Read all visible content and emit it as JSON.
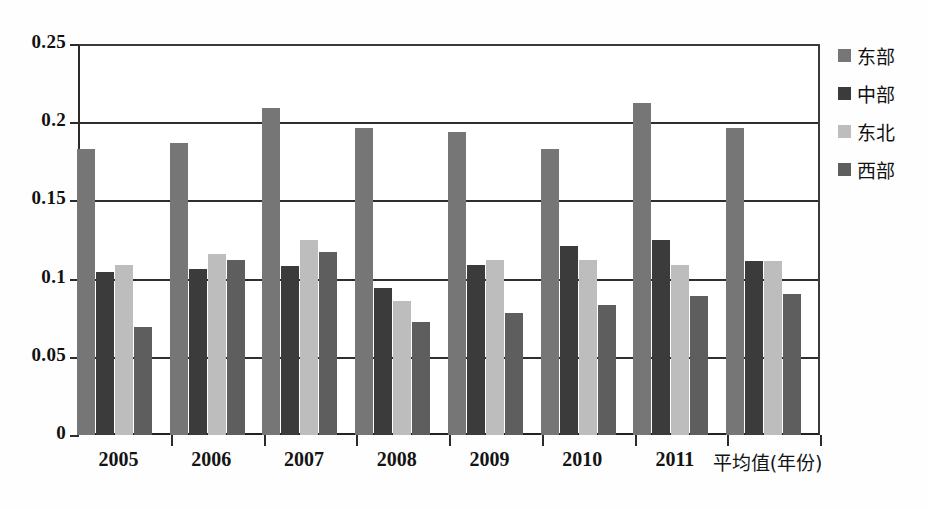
{
  "chart_data": {
    "type": "bar",
    "title": "",
    "xlabel": "平均值(年份)",
    "ylabel": "",
    "ylim": [
      0,
      0.25
    ],
    "ytick_labels": [
      "0.25",
      "0.2",
      "0.15",
      "0.1",
      "0.05",
      "0"
    ],
    "ytick_values": [
      0.25,
      0.2,
      0.15,
      0.1,
      0.05,
      0
    ],
    "grid": true,
    "legend_position": "right",
    "categories": [
      "2005",
      "2006",
      "2007",
      "2008",
      "2009",
      "2010",
      "2011",
      "平均值(年份)"
    ],
    "series": [
      {
        "name": "东部",
        "color": "#767676",
        "values": [
          0.183,
          0.187,
          0.209,
          0.196,
          0.194,
          0.183,
          0.212,
          0.196
        ]
      },
      {
        "name": "中部",
        "color": "#3b3b3b",
        "values": [
          0.104,
          0.106,
          0.108,
          0.094,
          0.109,
          0.121,
          0.125,
          0.111
        ]
      },
      {
        "name": "东北",
        "color": "#bdbdbd",
        "values": [
          0.109,
          0.116,
          0.125,
          0.086,
          0.112,
          0.112,
          0.109,
          0.111
        ]
      },
      {
        "name": "西部",
        "color": "#5e5e5e",
        "values": [
          0.069,
          0.112,
          0.117,
          0.072,
          0.078,
          0.083,
          0.089,
          0.09
        ]
      }
    ]
  },
  "axes": {
    "y_ticks": [
      "0.25",
      "0.2",
      "0.15",
      "0.1",
      "0.05",
      "0"
    ],
    "x_ticks": [
      "2005",
      "2006",
      "2007",
      "2008",
      "2009",
      "2010",
      "2011",
      "平均值(年份)"
    ]
  },
  "legend": {
    "items": [
      {
        "label": "东部",
        "color": "#767676"
      },
      {
        "label": "中部",
        "color": "#3b3b3b"
      },
      {
        "label": "东北",
        "color": "#bdbdbd"
      },
      {
        "label": "西部",
        "color": "#5e5e5e"
      }
    ]
  }
}
